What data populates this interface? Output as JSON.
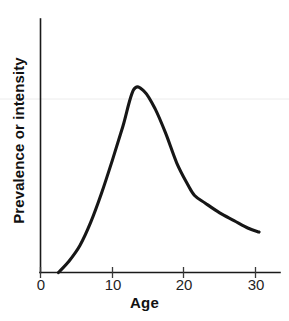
{
  "chart_data": {
    "type": "line",
    "title": "",
    "subtitle": "",
    "xlabel": "Age",
    "ylabel": "Prevalence or intensity",
    "xlim": [
      0,
      33.6
    ],
    "ylim": [
      0,
      1.06
    ],
    "xticks": [
      0,
      10,
      20,
      30
    ],
    "xtick_labels": [
      "0",
      "10",
      "20",
      "30"
    ],
    "yticks": [],
    "ytick_labels": [],
    "grid": false,
    "legend": null,
    "legend_position": "none",
    "annotations": [],
    "series": [
      {
        "name": "Prevalence or intensity by age",
        "color": "#161616",
        "x": [
          2.5,
          4.0,
          5.5,
          7.0,
          8.5,
          10.0,
          11.5,
          13.0,
          14.5,
          16.0,
          17.5,
          19.0,
          20.5,
          21.5,
          23.0,
          25.0,
          27.0,
          29.0,
          30.5
        ],
        "y": [
          0.0,
          0.06,
          0.14,
          0.26,
          0.41,
          0.58,
          0.76,
          0.95,
          0.94,
          0.85,
          0.72,
          0.57,
          0.46,
          0.4,
          0.36,
          0.31,
          0.27,
          0.23,
          0.21
        ]
      }
    ],
    "curve_shape": {
      "onset_age": 2.5,
      "peak_age": 13.0,
      "peak_value_relative": 1.0,
      "shoulder_age": 21.4,
      "end_age": 30.5,
      "end_value_relative": 0.21
    }
  },
  "axes": {
    "x_axis_name": "age-axis",
    "y_axis_name": "prevalence-axis"
  },
  "tick_labels": {
    "x": [
      "0",
      "10",
      "20",
      "30"
    ]
  },
  "labels": {
    "x_axis": "Age",
    "y_axis": "Prevalence or intensity"
  },
  "colors": {
    "curve": "#161616",
    "axis": "#1a1a1a",
    "text": "#111111",
    "background": "#ffffff"
  }
}
